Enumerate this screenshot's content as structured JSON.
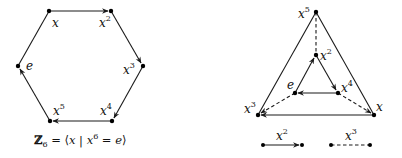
{
  "left_diagram": {
    "title": "Cayley graph of Z6 (hexagon)",
    "caption": {
      "group_symbol": "ℤ",
      "group_sub": "6",
      "rest_open": " = ⟨",
      "gen": "x",
      "bar": " | ",
      "rel_base": "x",
      "rel_exp": "6",
      "rel_eq": " = ",
      "identity": "e",
      "close": "⟩"
    },
    "nodes": [
      {
        "id": "x",
        "base": "x",
        "exp": ""
      },
      {
        "id": "x2",
        "base": "x",
        "exp": "2"
      },
      {
        "id": "x3",
        "base": "x",
        "exp": "3"
      },
      {
        "id": "x4",
        "base": "x",
        "exp": "4"
      },
      {
        "id": "x5",
        "base": "x",
        "exp": "5"
      },
      {
        "id": "e",
        "base": "e",
        "exp": ""
      }
    ],
    "edges": [
      {
        "from": "x",
        "to": "x2",
        "style": "solid"
      },
      {
        "from": "x2",
        "to": "x3",
        "style": "solid"
      },
      {
        "from": "x3",
        "to": "x4",
        "style": "solid"
      },
      {
        "from": "x4",
        "to": "x5",
        "style": "solid"
      },
      {
        "from": "x5",
        "to": "e",
        "style": "solid"
      },
      {
        "from": "e",
        "to": "x",
        "style": "solid"
      }
    ]
  },
  "right_diagram": {
    "title": "Cayley graph of Z6 with generators x^2 and x^3",
    "nodes": [
      {
        "id": "x5",
        "base": "x",
        "exp": "5"
      },
      {
        "id": "x2",
        "base": "x",
        "exp": "2"
      },
      {
        "id": "e",
        "base": "e",
        "exp": ""
      },
      {
        "id": "x4",
        "base": "x",
        "exp": "4"
      },
      {
        "id": "x3",
        "base": "x",
        "exp": "3"
      },
      {
        "id": "x",
        "base": "x",
        "exp": ""
      }
    ],
    "edges": [
      {
        "from": "e",
        "to": "x2",
        "style": "solid",
        "generator": "x^2"
      },
      {
        "from": "x2",
        "to": "x4",
        "style": "solid",
        "generator": "x^2"
      },
      {
        "from": "x4",
        "to": "e",
        "style": "solid",
        "generator": "x^2"
      },
      {
        "from": "x",
        "to": "x3",
        "style": "solid",
        "generator": "x^2"
      },
      {
        "from": "x3",
        "to": "x5",
        "style": "solid",
        "generator": "x^2"
      },
      {
        "from": "x5",
        "to": "x",
        "style": "solid",
        "generator": "x^2"
      },
      {
        "from": "x5",
        "to": "x2",
        "style": "dashed",
        "generator": "x^3"
      },
      {
        "from": "e",
        "to": "x3",
        "style": "dashed",
        "generator": "x^3"
      },
      {
        "from": "x4",
        "to": "x",
        "style": "dashed",
        "generator": "x^3"
      }
    ],
    "legend": [
      {
        "style": "solid",
        "base": "x",
        "exp": "2"
      },
      {
        "style": "dashed",
        "base": "x",
        "exp": "3"
      }
    ]
  }
}
